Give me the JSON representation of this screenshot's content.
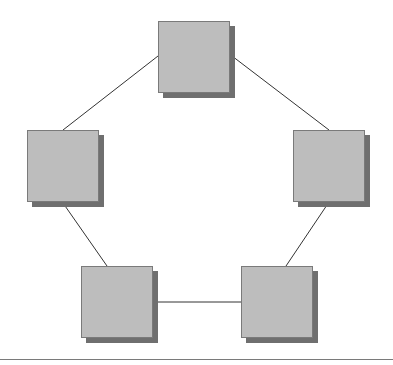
{
  "diagram": {
    "type": "ring-network",
    "node_color": "#bdbdbd",
    "shadow_color": "#6f6f6f",
    "edge_color": "#333333",
    "nodes": [
      {
        "id": "top",
        "x": 158,
        "y": 21
      },
      {
        "id": "left",
        "x": 27,
        "y": 130
      },
      {
        "id": "right",
        "x": 293,
        "y": 130
      },
      {
        "id": "bottom-left",
        "x": 81,
        "y": 266
      },
      {
        "id": "bottom-right",
        "x": 241,
        "y": 266
      }
    ],
    "edges": [
      [
        "top",
        "left"
      ],
      [
        "top",
        "right"
      ],
      [
        "left",
        "bottom-left"
      ],
      [
        "right",
        "bottom-right"
      ],
      [
        "bottom-left",
        "bottom-right"
      ]
    ]
  }
}
